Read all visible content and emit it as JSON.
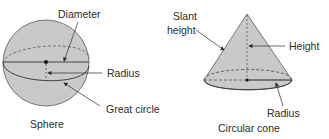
{
  "colors": {
    "fill": "#c9c9c9",
    "stroke": "#3a3a3a",
    "text": "#2b2b2b",
    "background": "#ffffff"
  },
  "sphere": {
    "caption": "Sphere",
    "labels": {
      "diameter": "Diameter",
      "radius": "Radius",
      "great_circle": "Great circle"
    }
  },
  "cone": {
    "caption": "Circular cone",
    "labels": {
      "slant_height_line1": "Slant",
      "slant_height_line2": "height",
      "height": "Height",
      "radius": "Radius"
    }
  }
}
